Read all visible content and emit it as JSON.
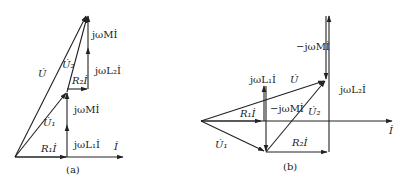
{
  "figure": {
    "panel_a": {
      "caption": "(a)",
      "labels": {
        "U": "U̇",
        "U1": "U̇₁",
        "U2": "U̇₂",
        "R1I": "R₁İ",
        "R2I": "R₂İ",
        "jwL1I": "jωL₁İ",
        "jwL2I": "jωL₂İ",
        "jwMI_lower": "jωMİ",
        "jwMI_upper": "jωMİ",
        "I": "İ"
      }
    },
    "panel_b": {
      "caption": "(b)",
      "labels": {
        "U": "U̇",
        "U1": "U̇₁",
        "U2": "U̇₂",
        "R1I": "R₁İ",
        "R2I": "R₂İ",
        "jwL1I": "jωL₁İ",
        "jwL2I": "jωL₂İ",
        "neg_jwMI_inner": "−jωMİ",
        "neg_jwMI_upper": "−jωMİ",
        "I": "İ"
      }
    },
    "stroke_color": "#222222",
    "background": "#ffffff"
  }
}
